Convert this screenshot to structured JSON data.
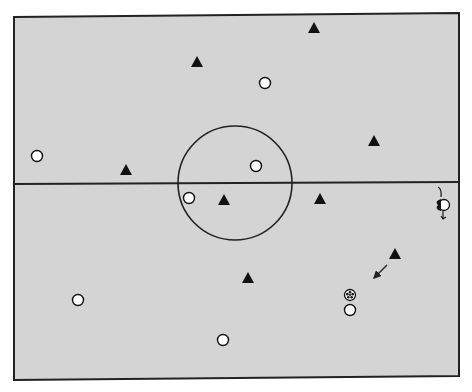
{
  "diagram": {
    "type": "soccer-field-tactics",
    "colors": {
      "field": "#d4d4d4",
      "lines": "#222222",
      "team_triangle": "#111111",
      "team_circle_fill": "#ffffff",
      "team_circle_stroke": "#111111",
      "background": "#ffffff"
    },
    "field": {
      "corners": {
        "top_left": [
          14,
          17
        ],
        "top_right": [
          459,
          13
        ],
        "bottom_right": [
          459,
          376
        ],
        "bottom_left": [
          14,
          380
        ]
      },
      "halfway_line_y": 183,
      "center_circle": {
        "cx": 235,
        "cy": 183,
        "r": 57
      }
    },
    "triangles": [
      {
        "id": "t1",
        "x": 314,
        "y": 28
      },
      {
        "id": "t2",
        "x": 197,
        "y": 62
      },
      {
        "id": "t3",
        "x": 374,
        "y": 141
      },
      {
        "id": "t4",
        "x": 126,
        "y": 170
      },
      {
        "id": "t5",
        "x": 224,
        "y": 200
      },
      {
        "id": "t6",
        "x": 320,
        "y": 199
      },
      {
        "id": "t7",
        "x": 395,
        "y": 254
      },
      {
        "id": "t8",
        "x": 248,
        "y": 278
      }
    ],
    "circles": [
      {
        "id": "c1",
        "x": 265,
        "y": 83
      },
      {
        "id": "c2",
        "x": 37,
        "y": 156
      },
      {
        "id": "c3",
        "x": 256,
        "y": 166
      },
      {
        "id": "c4",
        "x": 189,
        "y": 198
      },
      {
        "id": "c5",
        "x": 78,
        "y": 300
      },
      {
        "id": "c6",
        "x": 350,
        "y": 310
      },
      {
        "id": "c7",
        "x": 223,
        "y": 340
      }
    ],
    "goalkeeper": {
      "x": 444,
      "y": 205
    },
    "ball": {
      "x": 350,
      "y": 295
    },
    "arrows": [
      {
        "id": "a1",
        "from": [
          387,
          265
        ],
        "to": [
          374,
          278
        ]
      }
    ]
  }
}
